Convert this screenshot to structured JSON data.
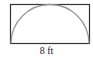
{
  "figure": {
    "shape": "rectangle with inscribed semicircle",
    "base_label": "8 ft",
    "colors": {
      "rectangle_stroke": "#333333",
      "arc_stroke": "#999999",
      "background": "#ffffff"
    }
  }
}
